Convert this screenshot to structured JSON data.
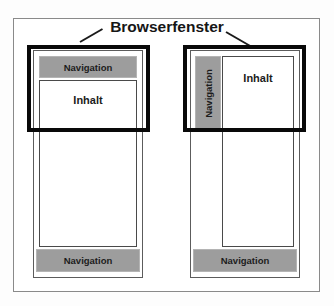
{
  "figure": {
    "title": "Browserfenster",
    "background_color": "#fdfdfd",
    "frame_border_color": "#8a8a8a",
    "nav_fill_color": "#9d9d9d",
    "content_fill_color": "#ffffff",
    "window_border_color": "#090909"
  },
  "diagrams": [
    {
      "id": "left",
      "layout": "horizontal-navigation",
      "blocks": [
        {
          "name": "navigation-top",
          "label": "Navigation",
          "kind": "navigation",
          "orientation": "horizontal"
        },
        {
          "name": "content",
          "label": "Inhalt",
          "kind": "content",
          "orientation": "horizontal"
        },
        {
          "name": "navigation-bottom",
          "label": "Navigation",
          "kind": "navigation",
          "orientation": "horizontal"
        }
      ],
      "window_label": "Browserfenster"
    },
    {
      "id": "right",
      "layout": "vertical-navigation",
      "blocks": [
        {
          "name": "navigation-side",
          "label": "Navigation",
          "kind": "navigation",
          "orientation": "vertical"
        },
        {
          "name": "content",
          "label": "Inhalt",
          "kind": "content",
          "orientation": "horizontal"
        },
        {
          "name": "navigation-bottom",
          "label": "Navigation",
          "kind": "navigation",
          "orientation": "horizontal"
        }
      ],
      "window_label": "Browserfenster"
    }
  ]
}
